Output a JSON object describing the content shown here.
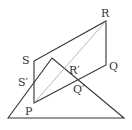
{
  "diagram": {
    "type": "geometry",
    "colors": {
      "stroke": "#333333",
      "diagonal": "#888888",
      "background": "#ffffff"
    },
    "labels": {
      "R": "R",
      "Q": "Q",
      "S": "S",
      "P": "P",
      "S_prime": "S′",
      "R_prime": "R′",
      "Q_prime": "Q′"
    },
    "points": {
      "P": [
        34,
        103
      ],
      "Q": [
        106,
        65
      ],
      "R": [
        106,
        21
      ],
      "S": [
        34,
        61
      ],
      "triangle_apex": [
        52,
        58
      ],
      "triangle_left": [
        8,
        118
      ],
      "triangle_right": [
        124,
        118
      ]
    }
  }
}
